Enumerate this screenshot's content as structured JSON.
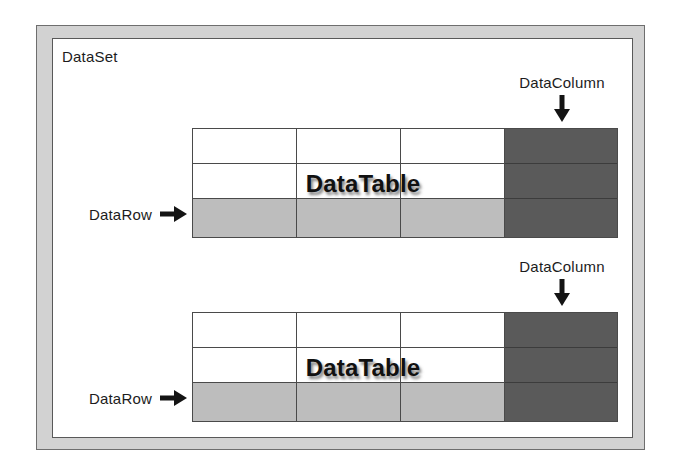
{
  "diagram": {
    "dataset": {
      "label": "DataSet",
      "frame_color": "#d2d2d2",
      "frame_border_color": "#6e6e6e",
      "panel_color": "#ffffff"
    },
    "row_highlight_color": "#bdbdbd",
    "column_highlight_color": "#5a5a5a",
    "grid_line_color": "#4a4a4a",
    "tables": [
      {
        "caption": "DataTable",
        "columns": 4,
        "rows": 3,
        "highlighted_column_index": 3,
        "highlighted_row_index": 2,
        "column_callout": {
          "label": "DataColumn",
          "arrow": "arrow-down"
        },
        "row_callout": {
          "label": "DataRow",
          "arrow": "arrow-right"
        }
      },
      {
        "caption": "DataTable",
        "columns": 4,
        "rows": 3,
        "highlighted_column_index": 3,
        "highlighted_row_index": 2,
        "column_callout": {
          "label": "DataColumn",
          "arrow": "arrow-down"
        },
        "row_callout": {
          "label": "DataRow",
          "arrow": "arrow-right"
        }
      }
    ]
  }
}
